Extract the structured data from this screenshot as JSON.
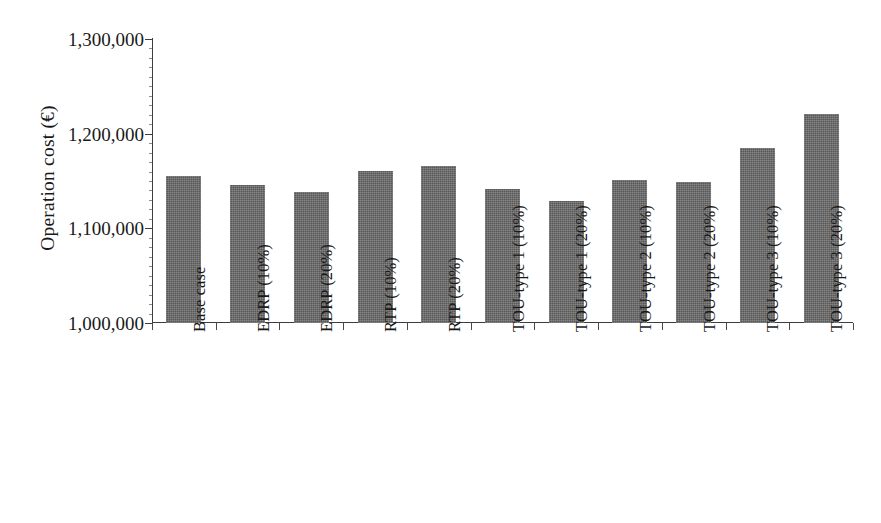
{
  "chart_data": {
    "type": "bar",
    "title": "",
    "xlabel": "",
    "ylabel": "Operation cost (€)",
    "ylim": [
      1000000,
      1300000
    ],
    "ytick_step": 100000,
    "yminor_step": 10000,
    "grid": false,
    "legend": null,
    "bar_color": "#575757",
    "axis_color": "#3d3d3d",
    "categories": [
      "Base case",
      "EDRP (10%)",
      "EDRP (20%)",
      "RTP (10%)",
      "RTP (20%)",
      "TOU-type 1 (10%)",
      "TOU-type 1 (20%)",
      "TOU-type 2 (10%)",
      "TOU-type 2 (20%)",
      "TOU-type 3 (10%)",
      "TOU-type 3 (20%)"
    ],
    "values": [
      1155000,
      1146000,
      1138000,
      1161000,
      1166000,
      1142000,
      1129000,
      1151000,
      1149000,
      1185000,
      1221000
    ],
    "ytick_labels": [
      "1,300,000",
      "1,200,000",
      "1,100,000",
      "1,000,000"
    ],
    "ytick_values": [
      1300000,
      1200000,
      1100000,
      1000000
    ]
  }
}
